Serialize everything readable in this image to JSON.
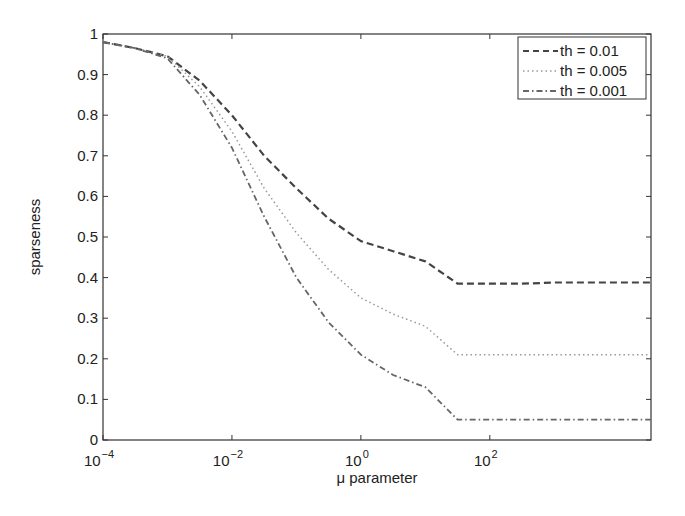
{
  "chart_data": {
    "type": "line",
    "title": "",
    "xlabel": "μ parameter",
    "ylabel": "sparseness",
    "xscale": "log",
    "xlim": [
      0.0001,
      31622.8
    ],
    "ylim": [
      0,
      1
    ],
    "x_ticks": [
      "10^-4",
      "10^-2",
      "10^0",
      "10^2"
    ],
    "x_tick_values": [
      0.0001,
      0.01,
      1,
      100
    ],
    "y_ticks": [
      "0",
      "0.1",
      "0.2",
      "0.3",
      "0.4",
      "0.5",
      "0.6",
      "0.7",
      "0.8",
      "0.9",
      "1"
    ],
    "grid": false,
    "legend_position": "upper right",
    "x": [
      0.0001,
      0.000316,
      0.001,
      0.00316,
      0.01,
      0.0316,
      0.1,
      0.316,
      1,
      3.16,
      10,
      31.6,
      100,
      316,
      1000,
      3162,
      31622
    ],
    "series": [
      {
        "name": "th = 0.01",
        "style": "dashed",
        "color": "#444444",
        "values": [
          0.98,
          0.965,
          0.945,
          0.885,
          0.8,
          0.7,
          0.62,
          0.545,
          0.49,
          0.465,
          0.44,
          0.385,
          0.385,
          0.385,
          0.388,
          0.388,
          0.388
        ]
      },
      {
        "name": "th = 0.005",
        "style": "dotted",
        "color": "#999999",
        "values": [
          0.98,
          0.965,
          0.945,
          0.87,
          0.76,
          0.62,
          0.51,
          0.42,
          0.35,
          0.31,
          0.28,
          0.21,
          0.21,
          0.21,
          0.21,
          0.21,
          0.21
        ]
      },
      {
        "name": "th = 0.001",
        "style": "dashdot",
        "color": "#666666",
        "values": [
          0.98,
          0.965,
          0.94,
          0.85,
          0.72,
          0.55,
          0.4,
          0.29,
          0.21,
          0.16,
          0.13,
          0.05,
          0.05,
          0.05,
          0.05,
          0.05,
          0.05
        ]
      }
    ]
  },
  "axes": {
    "xlabel": "μ parameter",
    "ylabel": "sparseness",
    "x_ticks": [
      {
        "base": "10",
        "exp": "−4"
      },
      {
        "base": "10",
        "exp": "−2"
      },
      {
        "base": "10",
        "exp": "0"
      },
      {
        "base": "10",
        "exp": "2"
      }
    ],
    "y_ticks": [
      "0",
      "0.1",
      "0.2",
      "0.3",
      "0.4",
      "0.5",
      "0.6",
      "0.7",
      "0.8",
      "0.9",
      "1"
    ]
  },
  "legend": {
    "items": [
      {
        "label": "th = 0.01"
      },
      {
        "label": "th = 0.005"
      },
      {
        "label": "th = 0.001"
      }
    ]
  }
}
